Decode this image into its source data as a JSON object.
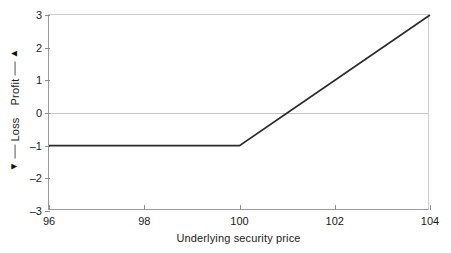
{
  "chart_data": {
    "type": "line",
    "title": "",
    "xlabel": "Underlying security price",
    "ylabel": "Loss ← → Profit",
    "ylabel_parts": {
      "profit": "Profit",
      "loss": "Loss",
      "up_arrow": "up-arrow",
      "down_arrow": "down-arrow"
    },
    "xlim": [
      96,
      104
    ],
    "ylim": [
      -3,
      3
    ],
    "xticks": [
      96,
      98,
      100,
      102,
      104
    ],
    "xtick_labels": [
      "96",
      "98",
      "100",
      "102",
      "104"
    ],
    "yticks": [
      3,
      2,
      1,
      0,
      -1,
      -2,
      -3
    ],
    "ytick_labels": [
      "3",
      "2",
      "1",
      "0",
      "–1",
      "–2",
      "–3"
    ],
    "grid": false,
    "zero_line": true,
    "legend": null,
    "series": [
      {
        "name": "Long call profit",
        "color": "#2b2b2b",
        "x": [
          96,
          100,
          101,
          104
        ],
        "values": [
          -1,
          -1,
          0,
          3
        ]
      }
    ],
    "annotations": {
      "strike": 100,
      "premium": 1,
      "breakeven": 101,
      "max_loss": -1,
      "max_profit_at_xmax": 3
    }
  },
  "colors": {
    "line": "#2b2b2b",
    "axis": "#9a9a9a",
    "zero_line": "#c4c4c4",
    "text": "#1a1a1a",
    "background": "#ffffff"
  }
}
